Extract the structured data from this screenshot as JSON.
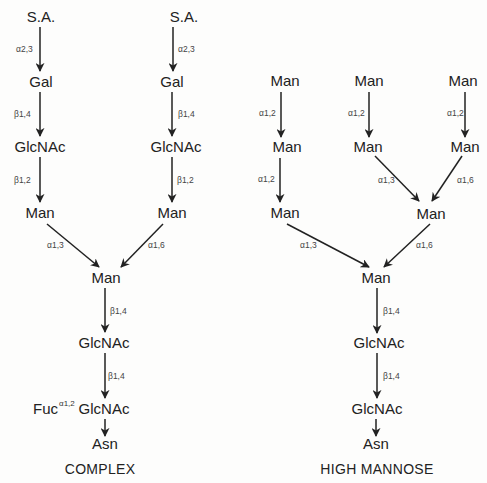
{
  "complex": {
    "title": "COMPLEX",
    "nodes": {
      "sa_left": "S.A.",
      "sa_right": "S.A.",
      "gal_left": "Gal",
      "gal_right": "Gal",
      "glcnac_left": "GlcNAc",
      "glcnac_right": "GlcNAc",
      "man_left": "Man",
      "man_right": "Man",
      "man_core": "Man",
      "glcnac_core1": "GlcNAc",
      "glcnac_core2": "GlcNAc",
      "fuc": "Fuc",
      "asn": "Asn"
    },
    "linkages": {
      "sa_gal_left": "α2,3",
      "sa_gal_right": "α2,3",
      "gal_glcnac_left": "β1,4",
      "gal_glcnac_right": "β1,4",
      "glcnac_man_left": "β1,2",
      "glcnac_man_right": "β1,2",
      "man_core_left": "α1,3",
      "man_core_right": "α1,6",
      "man_glcnac": "β1,4",
      "glcnac_glcnac": "β1,4",
      "fuc_glcnac": "α1,2"
    }
  },
  "high_mannose": {
    "title": "HIGH MANNOSE",
    "nodes": {
      "man_a1": "Man",
      "man_a2": "Man",
      "man_a3": "Man",
      "man_b1": "Man",
      "man_b2": "Man",
      "man_c1": "Man",
      "man_c2": "Man",
      "man_branch": "Man",
      "man_core": "Man",
      "glcnac_core1": "GlcNAc",
      "glcnac_core2": "GlcNAc",
      "asn": "Asn"
    },
    "linkages": {
      "a1_a2": "α1,2",
      "a2_a3": "α1,2",
      "b1_b2": "α1,2",
      "c1_c2": "α1,2",
      "b2_branch": "α1,3",
      "c2_branch": "α1,6",
      "a3_core": "α1,3",
      "branch_core": "α1,6",
      "man_glcnac": "β1,4",
      "glcnac_glcnac": "β1,4"
    }
  }
}
